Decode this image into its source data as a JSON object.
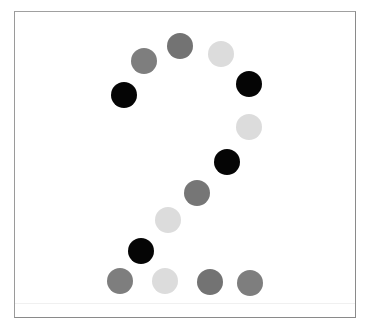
{
  "figure": {
    "depicted_digit": "2",
    "frame_color": "#8a8a8a",
    "background": "#ffffff"
  },
  "palette": {
    "black": "#050505",
    "dark_gray": "#737373",
    "mid_gray": "#7e7e7e",
    "light_gray": "#dcdcdc"
  },
  "dots": [
    {
      "x": 180,
      "y": 46,
      "color": "#737373"
    },
    {
      "x": 144,
      "y": 61,
      "color": "#7e7e7e"
    },
    {
      "x": 221,
      "y": 54,
      "color": "#dcdcdc"
    },
    {
      "x": 124,
      "y": 95,
      "color": "#050505"
    },
    {
      "x": 249,
      "y": 84,
      "color": "#050505"
    },
    {
      "x": 249,
      "y": 127,
      "color": "#dcdcdc"
    },
    {
      "x": 227,
      "y": 162,
      "color": "#050505"
    },
    {
      "x": 197,
      "y": 193,
      "color": "#767676"
    },
    {
      "x": 168,
      "y": 220,
      "color": "#dcdcdc"
    },
    {
      "x": 141,
      "y": 251,
      "color": "#050505"
    },
    {
      "x": 120,
      "y": 281,
      "color": "#7e7e7e"
    },
    {
      "x": 165,
      "y": 281,
      "color": "#dcdcdc"
    },
    {
      "x": 210,
      "y": 282,
      "color": "#737373"
    },
    {
      "x": 250,
      "y": 283,
      "color": "#7e7e7e"
    }
  ]
}
